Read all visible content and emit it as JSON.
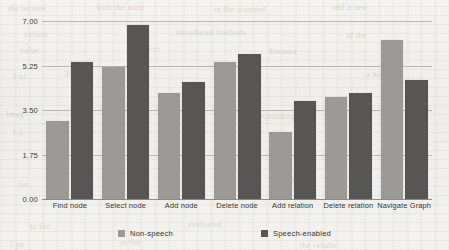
{
  "chart_data": {
    "type": "bar",
    "title": "",
    "xlabel": "",
    "ylabel": "",
    "ylim": [
      0,
      7
    ],
    "yticks": [
      "0.00",
      "1.75",
      "3.50",
      "5.25",
      "7.00"
    ],
    "ytick_values": [
      0,
      1.75,
      3.5,
      5.25,
      7
    ],
    "grid": true,
    "legend_position": "bottom",
    "categories": [
      "Find node",
      "Select node",
      "Add node",
      "Delete node",
      "Add relation",
      "Delete relation",
      "Navigate Graph"
    ],
    "series": [
      {
        "name": "Non-speech",
        "color": "#9b9a96",
        "values": [
          3.05,
          5.2,
          4.15,
          5.4,
          2.65,
          4.0,
          6.25
        ]
      },
      {
        "name": "Speech-enabled",
        "color": "#575654",
        "values": [
          5.4,
          6.85,
          4.6,
          5.7,
          3.85,
          4.15,
          4.7
        ]
      }
    ]
  },
  "legend": {
    "items": [
      {
        "label": "Non-speech",
        "swatch": "non-speech"
      },
      {
        "label": "Speech-enabled",
        "swatch": "speech-enabled"
      }
    ]
  },
  "background_artifacts": [
    {
      "text": "the lecture",
      "x": 8,
      "y": 4
    },
    {
      "text": "with the most",
      "x": 96,
      "y": 3
    },
    {
      "text": "in the scanned",
      "x": 214,
      "y": 5
    },
    {
      "text": "and a new",
      "x": 332,
      "y": 3
    },
    {
      "text": "collate",
      "x": 24,
      "y": 30
    },
    {
      "text": "introduced methods",
      "x": 176,
      "y": 28
    },
    {
      "text": "of the",
      "x": 346,
      "y": 31
    },
    {
      "text": "value",
      "x": 20,
      "y": 46
    },
    {
      "text": "6 +-",
      "x": 146,
      "y": 44
    },
    {
      "text": "distance",
      "x": 268,
      "y": 47
    },
    {
      "text": "3 of",
      "x": 12,
      "y": 72
    },
    {
      "text": "300",
      "x": 64,
      "y": 70
    },
    {
      "text": "is a",
      "x": 238,
      "y": 74
    },
    {
      "text": "a mere",
      "x": 366,
      "y": 70
    },
    {
      "text": "Imag",
      "x": 6,
      "y": 110
    },
    {
      "text": "1/2",
      "x": 12,
      "y": 128
    },
    {
      "text": "corresponding",
      "x": 244,
      "y": 112
    },
    {
      "text": "the as",
      "x": 382,
      "y": 130
    },
    {
      "text": "for",
      "x": 18,
      "y": 180
    },
    {
      "text": "words",
      "x": 276,
      "y": 176
    },
    {
      "text": "to the",
      "x": 30,
      "y": 222
    },
    {
      "text": "evaluated",
      "x": 188,
      "y": 220
    },
    {
      "text": "f po",
      "x": 10,
      "y": 240
    },
    {
      "text": "in the",
      "x": 120,
      "y": 238
    },
    {
      "text": "the results",
      "x": 300,
      "y": 241
    }
  ]
}
